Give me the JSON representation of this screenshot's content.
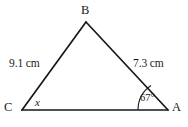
{
  "figure": {
    "type": "triangle-diagram",
    "background_color": "#ffffff",
    "stroke_color": "#17171c",
    "vertices": {
      "B": {
        "label": "B",
        "x": 86,
        "y": 22
      },
      "C": {
        "label": "C",
        "x": 22,
        "y": 110
      },
      "A": {
        "label": "A",
        "x": 168,
        "y": 110
      }
    },
    "sides": {
      "CB": {
        "label": "9.1 cm",
        "value": 9.1,
        "unit": "cm"
      },
      "BA": {
        "label": "7.3 cm",
        "value": 7.3,
        "unit": "cm"
      },
      "CA": {
        "label": "",
        "value": null,
        "unit": ""
      }
    },
    "angles": {
      "at_A": {
        "label": "67°",
        "value": 67,
        "unit": "degrees",
        "marked": true
      },
      "at_C": {
        "label": "x",
        "value": null,
        "unit": "unknown",
        "marked": false
      }
    }
  }
}
